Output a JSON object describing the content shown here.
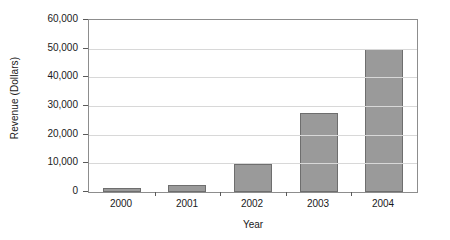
{
  "chart_data": {
    "type": "bar",
    "title": "",
    "xlabel": "Year",
    "ylabel": "Revenue (Dollars)",
    "categories": [
      "2000",
      "2001",
      "2002",
      "2003",
      "2004"
    ],
    "values": [
      1400,
      2500,
      9800,
      27500,
      50000
    ],
    "series": [
      {
        "name": "Revenue",
        "values": [
          1400,
          2500,
          9800,
          27500,
          50000
        ]
      }
    ],
    "ylim": [
      0,
      60000
    ],
    "ytick_values": [
      0,
      10000,
      20000,
      30000,
      40000,
      50000,
      60000
    ],
    "ytick_labels": [
      "0",
      "10,000",
      "20,000",
      "30,000",
      "40,000",
      "50,000",
      "60,000"
    ],
    "grid": true,
    "grid_axis": "y",
    "legend": false,
    "legend_position": "none",
    "bar_color": "#9a9a9a",
    "bar_border_color": "#6e6e6e",
    "gridline_color": "#d8d8d8",
    "axis_color": "#8d8d8d",
    "background_color": "#ffffff"
  }
}
